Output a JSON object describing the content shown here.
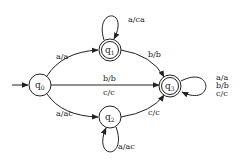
{
  "diagram": {
    "type": "finite-state-transducer",
    "initial_state": "q0",
    "states": [
      {
        "id": "q0",
        "name": "q",
        "sub": "0",
        "accepting": false
      },
      {
        "id": "q1",
        "name": "q",
        "sub": "1",
        "accepting": true
      },
      {
        "id": "q2",
        "name": "q",
        "sub": "2",
        "accepting": false
      },
      {
        "id": "q3",
        "name": "q",
        "sub": "3",
        "accepting": true
      }
    ],
    "transitions": [
      {
        "from": "q0",
        "to": "q1",
        "label": "a/a"
      },
      {
        "from": "q0",
        "to": "q2",
        "label": "a/ac"
      },
      {
        "from": "q0",
        "to": "q3",
        "label_top": "b/b",
        "label_bottom": "c/c"
      },
      {
        "from": "q1",
        "to": "q1",
        "label": "a/ca"
      },
      {
        "from": "q1",
        "to": "q3",
        "label": "b/b"
      },
      {
        "from": "q2",
        "to": "q2",
        "label": "a/ac"
      },
      {
        "from": "q2",
        "to": "q3",
        "label": "c/c"
      },
      {
        "from": "q3",
        "to": "q3",
        "labels": [
          "a/a",
          "b/b",
          "c/c"
        ]
      }
    ]
  }
}
